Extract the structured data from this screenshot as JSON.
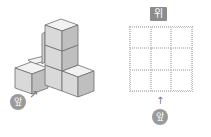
{
  "left_figure": {
    "description": "isometric stack of unit cubes",
    "cube_count_visible": 6,
    "front_label": "앞",
    "front_arrow": "↗"
  },
  "right_figure": {
    "top_label": "위",
    "grid": {
      "rows": 3,
      "cols": 3
    },
    "front_arrow": "↑",
    "front_label": "앞"
  },
  "colors": {
    "cube_top": "#f2f2f2",
    "cube_front": "#d9d9d9",
    "cube_side": "#bfbfbf",
    "cube_edge": "#6e6e6e",
    "label_bg": "#8c8c8c",
    "grid_line": "#c8c8c8"
  }
}
